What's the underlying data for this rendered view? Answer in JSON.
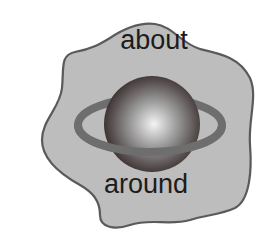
{
  "diagram": {
    "top_label": "about",
    "bottom_label": "around",
    "shapes": {
      "blob": {
        "fill": "#bdbdbd",
        "stroke": "#5a5a5a"
      },
      "planet": {
        "highlight": "#f2f2f2",
        "mid": "#8a8a8a",
        "shadow": "#2a1e1e"
      },
      "ring": {
        "color": "#6e6e6e"
      }
    }
  }
}
